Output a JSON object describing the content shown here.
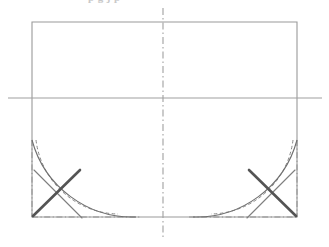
{
  "document": {
    "type": "technical-line-drawing",
    "canvas": {
      "width": 329,
      "height": 247,
      "background": "#ffffff"
    },
    "title_remnant": "p g j p",
    "title_note": "cropped title, only descenders visible at top edge"
  },
  "colors": {
    "outline": "#9a9a9a",
    "centerline": "#a0a0a0",
    "construction": "#8f8f8f",
    "arc_solid": "#6f6f6f",
    "arc_dashed": "#8a8a8a",
    "crossing_heavy": "#545454",
    "crossing_light": "#7e7e7e",
    "faint_text": "#c9c9c9"
  },
  "geometry": {
    "rectangle": {
      "name": "main-outline-rectangle",
      "left": 32,
      "top": 22,
      "right": 297,
      "bottom": 217,
      "stroke": "#9a9a9a",
      "stroke_width": 1.1,
      "style": "solid"
    },
    "horizontal_centerline": {
      "name": "horizontal-center-line",
      "x1": 8,
      "y1": 98,
      "x2": 322,
      "y2": 98,
      "stroke": "#a0a0a0",
      "stroke_width": 1.1,
      "style": "solid"
    },
    "vertical_centerline": {
      "name": "vertical-center-line",
      "x1": 163,
      "y1": 8,
      "x2": 163,
      "y2": 240,
      "stroke": "#a0a0a0",
      "stroke_width": 1.1,
      "style": "dash-dot",
      "dasharray": "7,3,1.5,3"
    },
    "left_corner": {
      "name": "left-bottom-corner-detail",
      "arc_solid": {
        "start_x": 32,
        "start_y": 140,
        "end_x": 136,
        "end_y": 217,
        "radius": 104
      },
      "arc_dashed": {
        "start_x": 36,
        "start_y": 140,
        "end_x": 118,
        "end_y": 214,
        "radius": 84
      },
      "construction_vertical": {
        "x": 32,
        "y1": 140,
        "y2": 217
      },
      "construction_horizontal": {
        "y": 217,
        "x1": 32,
        "x2": 140
      },
      "crossing_heavy": {
        "x1": 33,
        "y1": 216,
        "x2": 80,
        "y2": 170
      },
      "crossing_light": {
        "x1": 34,
        "y1": 170,
        "x2": 82,
        "y2": 218
      }
    },
    "right_corner": {
      "name": "right-bottom-corner-detail",
      "arc_solid": {
        "start_x": 297,
        "start_y": 140,
        "end_x": 193,
        "end_y": 217,
        "radius": 104
      },
      "arc_dashed": {
        "start_x": 293,
        "start_y": 140,
        "end_x": 211,
        "end_y": 214,
        "radius": 84
      },
      "construction_vertical": {
        "x": 297,
        "y1": 140,
        "y2": 217
      },
      "construction_horizontal": {
        "y": 217,
        "x1": 189,
        "x2": 297
      },
      "crossing_heavy": {
        "x1": 296,
        "y1": 216,
        "x2": 249,
        "y2": 170
      },
      "crossing_light": {
        "x1": 295,
        "y1": 170,
        "x2": 247,
        "y2": 218
      }
    }
  }
}
